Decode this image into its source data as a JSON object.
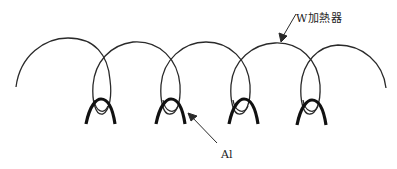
{
  "diagram": {
    "labels": {
      "heater": "W加熱器",
      "aluminum": "Al"
    },
    "colors": {
      "line": "#2a2a2a",
      "background": "#ffffff"
    },
    "components": {
      "heater_coil": {
        "name": "W加熱器",
        "type": "tungsten helical coil",
        "loops": 4
      },
      "aluminum_charges": {
        "name": "Al",
        "count": 4,
        "centers_x": [
          100,
          170,
          240,
          310
        ]
      }
    }
  }
}
